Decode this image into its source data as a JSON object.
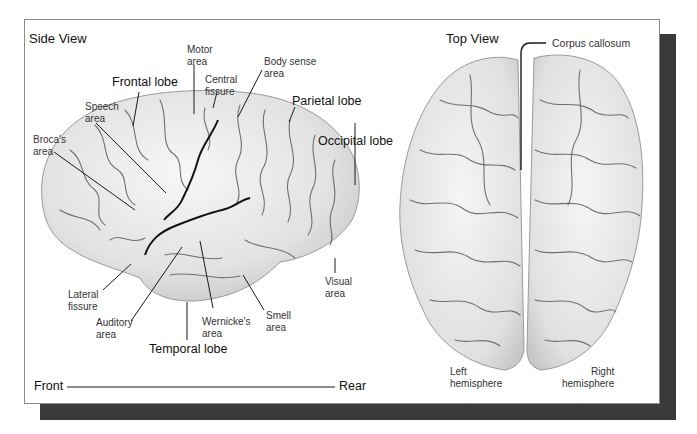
{
  "side_view": {
    "title": "Side View",
    "labels": {
      "motor_area": "Motor\narea",
      "body_sense_area": "Body sense\narea",
      "central_fissure": "Central\nfissure",
      "speech_area": "Speech\narea",
      "brocas_area": "Broca's\narea",
      "lateral_fissure": "Lateral\nfissure",
      "auditory_area": "Auditory\narea",
      "wernickes_area": "Wernicke's\narea",
      "smell_area": "Smell\narea",
      "visual_area": "Visual\narea"
    },
    "lobes": {
      "frontal": "Frontal lobe",
      "parietal": "Parietal lobe",
      "occipital": "Occipital lobe",
      "temporal": "Temporal lobe"
    },
    "axis": {
      "front": "Front",
      "rear": "Rear"
    }
  },
  "top_view": {
    "title": "Top View",
    "labels": {
      "corpus_callosum": "Corpus callosum",
      "left_hemisphere": "Left\nhemisphere",
      "right_hemisphere": "Right\nhemisphere"
    }
  },
  "colors": {
    "shadow": "#3a3a3a",
    "brain_fill": "#e6e6e6",
    "sulci": "#6a6a6a",
    "leader_lines": "#1a1a1a"
  }
}
